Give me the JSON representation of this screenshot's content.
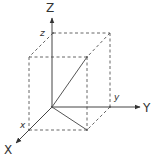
{
  "diagram": {
    "type": "3d-coordinate-system",
    "colors": {
      "axis": "#444444",
      "dashed": "#555555",
      "vector": "#555555",
      "text": "#333333",
      "background": "#ffffff"
    },
    "axes": {
      "z_label": "Z",
      "y_label": "Y",
      "x_label": "X"
    },
    "coordinates": {
      "z_label": "z",
      "y_label": "y",
      "x_label": "x"
    },
    "points": {
      "origin": [
        52,
        107
      ],
      "z_axis_end": [
        52,
        18
      ],
      "y_axis_end": [
        140,
        107
      ],
      "x_axis_end": [
        16,
        143
      ],
      "back_top_left": [
        53,
        33
      ],
      "back_top_right": [
        110,
        33
      ],
      "front_top_left": [
        29,
        57
      ],
      "front_top_right": [
        87,
        57
      ],
      "front_bottom_left": [
        29,
        130
      ],
      "front_bottom_right": [
        87,
        130
      ],
      "back_bottom_right": [
        110,
        107
      ]
    }
  }
}
